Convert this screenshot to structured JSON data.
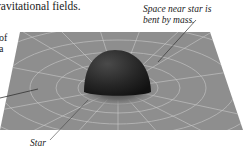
{
  "heading": {
    "text": "ravitational fields."
  },
  "left_fragment": {
    "lines": [
      "of",
      "a"
    ]
  },
  "callouts": {
    "space_bent": "Space near star is bent by mass.",
    "space_bent_line1": "Space near star is",
    "space_bent_line2": "bent by mass.",
    "star": "Star"
  },
  "diagram": {
    "plane_color": "#8c8c8c",
    "grid_color": "#c8c8c8",
    "star_color": "#1e1e1e"
  }
}
